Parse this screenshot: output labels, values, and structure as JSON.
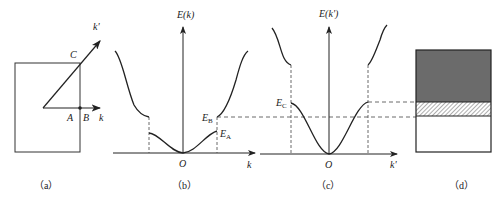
{
  "panels": {
    "a": {
      "caption": "（a）",
      "labels": {
        "k_prime": "k'",
        "C": "C",
        "A": "A",
        "B": "B",
        "k": "k"
      }
    },
    "b": {
      "caption": "（b）",
      "y_axis": "E(k)",
      "x_axis": "k",
      "origin": "O",
      "E_B": "E",
      "E_B_sub": "B",
      "E_A": "E",
      "E_A_sub": "A"
    },
    "c": {
      "caption": "（c）",
      "y_axis": "E(k')",
      "x_axis": "k'",
      "origin": "O",
      "E_C": "E",
      "E_C_sub": "C"
    },
    "d": {
      "caption": "（d）",
      "colors": {
        "filled": "#6b6b6b",
        "hatch": "#888888",
        "empty": "#ffffff"
      }
    }
  },
  "colors": {
    "stroke": "#222222",
    "dash": "#444444"
  }
}
